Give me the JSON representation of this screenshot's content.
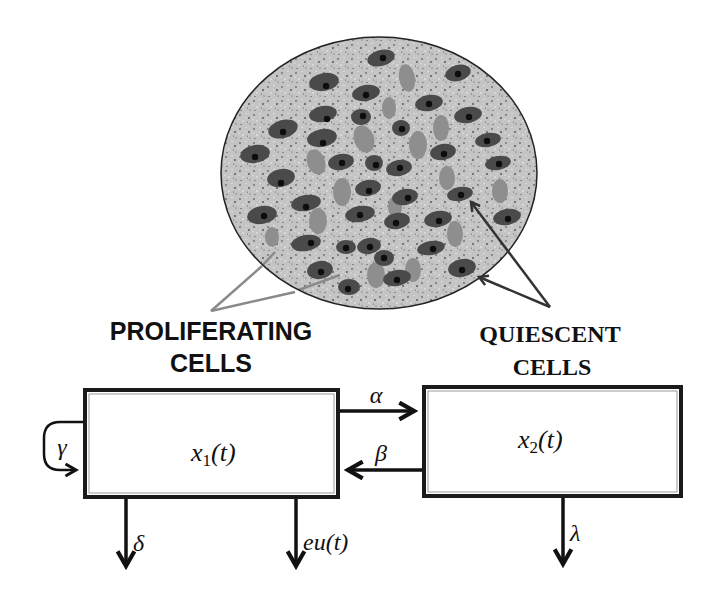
{
  "diagram": {
    "type": "compartment-model",
    "illustration": {
      "description": "tumor-tissue-section",
      "proliferating_cell_color": "#4a4a4a",
      "quiescent_cell_color": "#8e8e8e",
      "background_color": "#bdbdbd",
      "outline_color": "#222222"
    },
    "labels": {
      "proliferating_line1": "PROLIFERATING",
      "proliferating_line2": "CELLS",
      "quiescent_line1": "QUIESCENT",
      "quiescent_line2": "CELLS"
    },
    "compartments": [
      {
        "id": "x1",
        "var": "x",
        "sub": "1",
        "arg": "(t)",
        "name": "proliferating"
      },
      {
        "id": "x2",
        "var": "x",
        "sub": "2",
        "arg": "(t)",
        "name": "quiescent"
      }
    ],
    "transitions": {
      "alpha": {
        "symbol": "α",
        "from": "x1",
        "to": "x2"
      },
      "beta": {
        "symbol": "β",
        "from": "x2",
        "to": "x1"
      },
      "gamma": {
        "symbol": "γ",
        "from": "x1",
        "to": "x1"
      },
      "delta": {
        "symbol": "δ",
        "from": "x1",
        "to": "out"
      },
      "control": {
        "symbol_e": "eu",
        "symbol_arg": "(t)",
        "from": "x1",
        "to": "out"
      },
      "lambda": {
        "symbol": "λ",
        "from": "x2",
        "to": "out"
      }
    },
    "pointer_colors": {
      "proliferating": "#8a8a8a",
      "quiescent": "#333333"
    }
  }
}
